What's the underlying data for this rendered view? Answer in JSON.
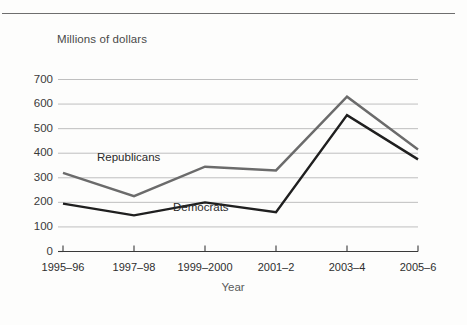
{
  "chart_data": {
    "type": "line",
    "title": "Millions of dollars",
    "xlabel": "Year",
    "ylabel": "Millions of dollars",
    "categories": [
      "1995–96",
      "1997–98",
      "1999–2000",
      "2001–2",
      "2003–4",
      "2005–6"
    ],
    "ylim": [
      0,
      700
    ],
    "ytick_labels": [
      "0",
      "100",
      "200",
      "300",
      "400",
      "500",
      "600",
      "700"
    ],
    "yticks": [
      0,
      100,
      200,
      300,
      400,
      500,
      600,
      700
    ],
    "grid": true,
    "legend_position": "inline-annotation",
    "series": [
      {
        "name": "Republicans",
        "values": [
          320,
          225,
          345,
          330,
          630,
          415
        ],
        "color": "#6b6b6b"
      },
      {
        "name": "Democrats",
        "values": [
          195,
          147,
          200,
          160,
          555,
          375
        ],
        "color": "#1f1f1f"
      }
    ]
  },
  "annotations": {
    "republicans_label": "Republicans",
    "democrats_label": "Democrats"
  },
  "colors": {
    "background": "#fdfdfc",
    "grid": "#b8b8b8",
    "axis": "#3a3a3a",
    "top_rule": "#6e6e6e",
    "title_text": "#4a4a4a"
  }
}
